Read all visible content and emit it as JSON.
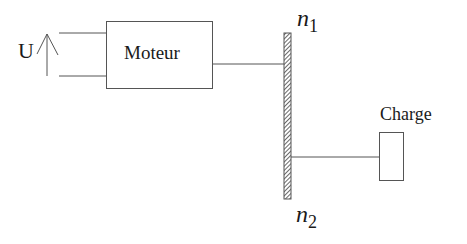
{
  "diagram": {
    "voltage_label": "U",
    "motor_label": "Moteur",
    "load_label": "Charge",
    "gear_top": {
      "base": "n",
      "subscript": "1"
    },
    "gear_bottom": {
      "base": "n",
      "subscript": "2"
    }
  },
  "colors": {
    "stroke": "#555555",
    "text": "#1a1a1a",
    "background": "#ffffff"
  }
}
